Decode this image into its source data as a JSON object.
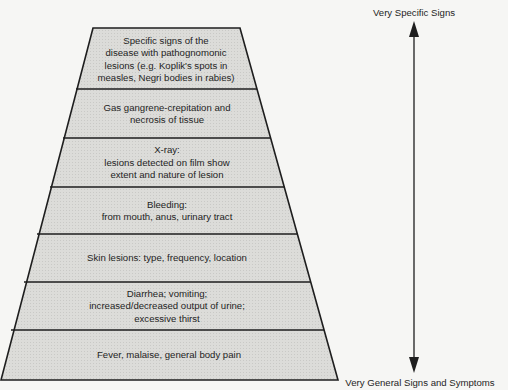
{
  "diagram": {
    "type": "pyramid",
    "fill_color": "#d9d9d6",
    "stroke_color": "#1e1e1e",
    "layers": [
      {
        "text": "Specific signs of the\ndisease with pathognomonic\nlesions (e.g. Koplik's spots in\nmeasles, Negri bodies in rabies)"
      },
      {
        "text": "Gas gangrene-crepitation and\nnecrosis of tissue"
      },
      {
        "text": "X-ray:\nlesions detected on film show\nextent and nature of lesion"
      },
      {
        "text": "Bleeding:\nfrom mouth, anus, urinary tract"
      },
      {
        "text": "Skin lesions: type, frequency, location"
      },
      {
        "text": "Diarrhea; vomiting;\nincreased/decreased output of urine;\nexcessive thirst"
      },
      {
        "text": "Fever, malaise, general body pain"
      }
    ]
  },
  "axis": {
    "top_label": "Very Specific Signs",
    "bottom_label": "Very General Signs and Symptoms",
    "direction": "bidirectional-vertical"
  }
}
